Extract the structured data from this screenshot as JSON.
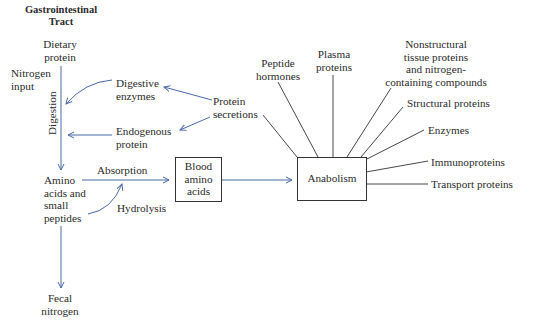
{
  "diagram": {
    "title": "Gastrointestinal\nTract",
    "nodes": {
      "dietary_protein": "Dietary\nprotein",
      "nitrogen_input": "Nitrogen\ninput",
      "digestion": "Digestion",
      "digestive_enzymes": "Digestive\nenzymes",
      "endogenous_protein": "Endogenous\nprotein",
      "protein_secretions": "Protein\nsecretions",
      "amino_acids": "Amino\nacids and\nsmall\npeptides",
      "absorption": "Absorption",
      "hydrolysis": "Hydrolysis",
      "blood_amino_acids": "Blood\namino\nacids",
      "anabolism": "Anabolism",
      "fecal_nitrogen": "Fecal\nnitrogen"
    },
    "anabolism_products": [
      "Peptide\nhormones",
      "Plasma\nproteins",
      "Nonstructural\ntissue proteins\nand nitrogen-\ncontaining compounds",
      "Structural proteins",
      "Enzymes",
      "Immunoproteins",
      "Transport proteins"
    ],
    "colors": {
      "arrow_blue": "#4a6aa8",
      "line_dark": "#333333"
    }
  }
}
